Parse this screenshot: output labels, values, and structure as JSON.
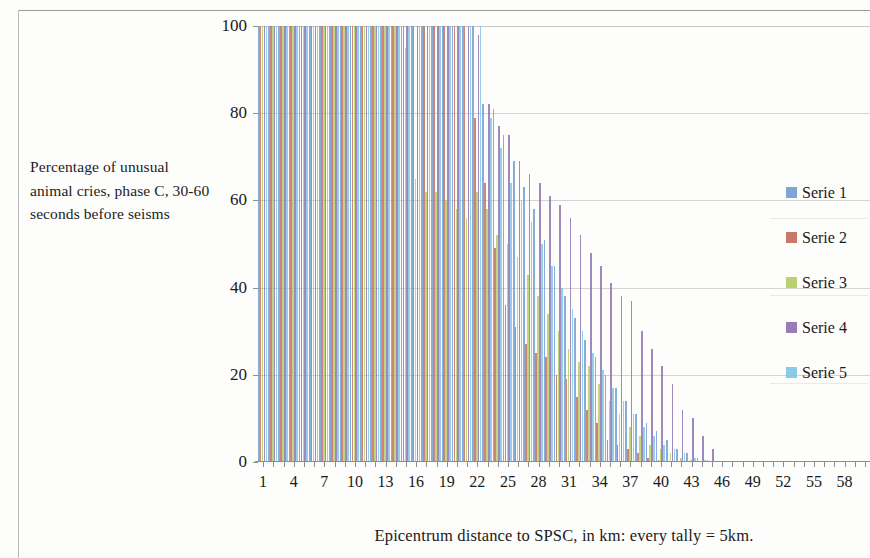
{
  "chart_data": {
    "type": "bar",
    "title": "",
    "xlabel": "Epicentrum distance to SPSC, in km: every tally = 5km.",
    "ylabel": "Percentage of unusual animal cries, phase C, 30-60 seconds before seisms",
    "ylim": [
      0,
      100
    ],
    "yticks": [
      0,
      20,
      40,
      60,
      80,
      100
    ],
    "xlim": [
      1,
      60
    ],
    "xticks": [
      1,
      4,
      7,
      10,
      13,
      16,
      19,
      22,
      25,
      28,
      31,
      34,
      37,
      40,
      43,
      46,
      49,
      52,
      55,
      58
    ],
    "grid": true,
    "legend_position": "right",
    "categories": [
      1,
      2,
      3,
      4,
      5,
      6,
      7,
      8,
      9,
      10,
      11,
      12,
      13,
      14,
      15,
      16,
      17,
      18,
      19,
      20,
      21,
      22,
      23,
      24,
      25,
      26,
      27,
      28,
      29,
      30,
      31,
      32,
      33,
      34,
      35,
      36,
      37,
      38,
      39,
      40,
      41,
      42,
      43,
      44,
      45,
      46,
      47,
      48,
      49,
      50,
      51,
      52,
      53,
      54,
      55,
      56,
      57,
      58,
      59,
      60
    ],
    "series": [
      {
        "name": "Serie 1",
        "color": "#6f9bd1",
        "values": [
          100,
          100,
          100,
          100,
          100,
          100,
          100,
          100,
          100,
          100,
          100,
          100,
          100,
          100,
          100,
          100,
          100,
          100,
          100,
          100,
          100,
          100,
          82,
          81,
          75,
          69,
          63,
          58,
          51,
          45,
          38,
          33,
          28,
          24,
          20,
          17,
          14,
          11,
          9,
          7,
          5,
          3,
          2,
          1,
          0.5,
          0,
          0,
          0,
          0,
          0,
          0,
          0,
          0,
          0,
          0,
          0,
          0,
          0,
          0,
          0
        ]
      },
      {
        "name": "Serie 2",
        "color": "#c26a5a",
        "values": [
          100,
          100,
          100,
          100,
          100,
          100,
          100,
          100,
          100,
          100,
          100,
          100,
          100,
          100,
          100,
          100,
          100,
          100,
          100,
          100,
          100,
          79,
          64,
          49,
          36,
          31,
          27,
          25,
          24,
          20,
          19,
          15,
          12,
          9,
          5,
          4,
          3,
          2,
          1,
          0.5,
          0,
          0,
          0,
          0,
          0,
          0,
          0,
          0,
          0,
          0,
          0,
          0,
          0,
          0,
          0,
          0,
          0,
          0,
          0,
          0
        ]
      },
      {
        "name": "Serie 3",
        "color": "#b3cc63",
        "values": [
          100,
          100,
          100,
          100,
          100,
          100,
          100,
          100,
          100,
          100,
          100,
          100,
          100,
          100,
          95,
          65,
          62,
          62,
          60,
          58,
          56,
          62,
          58,
          52,
          50,
          47,
          43,
          38,
          34,
          30,
          26,
          23,
          22,
          18,
          14,
          11,
          8,
          6,
          4,
          3,
          2,
          1,
          0.5,
          0,
          0,
          0,
          0,
          0,
          0,
          0,
          0,
          0,
          0,
          0,
          0,
          0,
          0,
          0,
          0,
          0
        ]
      },
      {
        "name": "Serie 4",
        "color": "#8b6fae",
        "values": [
          100,
          100,
          100,
          100,
          100,
          100,
          100,
          100,
          100,
          100,
          100,
          100,
          100,
          100,
          100,
          100,
          100,
          100,
          100,
          100,
          100,
          98,
          82,
          77,
          75,
          69,
          66,
          64,
          61,
          59,
          56,
          52,
          48,
          45,
          41,
          38,
          37,
          30,
          26,
          22,
          18,
          12,
          10,
          6,
          3,
          0,
          0,
          0,
          0,
          0,
          0,
          0,
          0,
          0,
          0,
          0,
          0,
          0,
          0,
          0
        ]
      },
      {
        "name": "Serie 5",
        "color": "#7fc4e8",
        "values": [
          100,
          100,
          100,
          100,
          100,
          100,
          100,
          100,
          100,
          100,
          100,
          100,
          100,
          100,
          100,
          100,
          100,
          100,
          100,
          100,
          100,
          100,
          79,
          72,
          64,
          60,
          55,
          50,
          45,
          40,
          35,
          30,
          25,
          21,
          17,
          14,
          11,
          8,
          6,
          4,
          3,
          2,
          1,
          0.5,
          0,
          0,
          0,
          0,
          0,
          0,
          0,
          0,
          0,
          0,
          0,
          0,
          0,
          0,
          0,
          0
        ]
      }
    ]
  },
  "legend": {
    "items": [
      {
        "label": "Serie 1",
        "color": "#6f9bd1"
      },
      {
        "label": "Serie 2",
        "color": "#c26a5a"
      },
      {
        "label": "Serie 3",
        "color": "#b3cc63"
      },
      {
        "label": "Serie 4",
        "color": "#8b6fae"
      },
      {
        "label": "Serie 5",
        "color": "#7fc4e8"
      }
    ]
  },
  "axis": {
    "ylabel_text": "Percentage of unusual animal cries, phase C, 30-60 seconds before seisms",
    "xtitle_text": "Epicentrum distance to SPSC, in km: every tally = 5km."
  }
}
